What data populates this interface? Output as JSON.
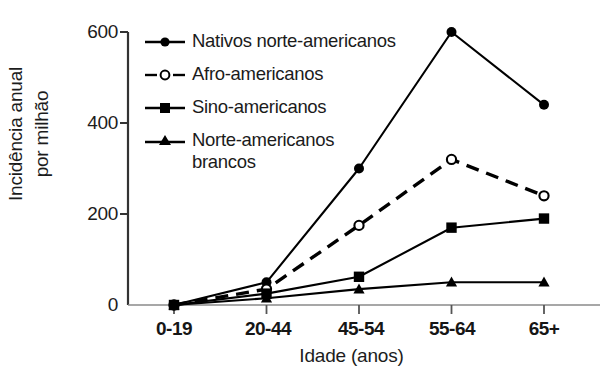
{
  "chart_data": {
    "type": "line",
    "title": "",
    "xlabel": "Idade (anos)",
    "ylabel": "Incidência anual\npor milhão",
    "categories": [
      "0-19",
      "20-44",
      "45-54",
      "55-64",
      "65+"
    ],
    "yticks": [
      0,
      200,
      400,
      600
    ],
    "ylim": [
      0,
      620
    ],
    "grid": false,
    "legend_position": "top-left-inside",
    "series": [
      {
        "name": "Nativos norte-americanos",
        "values": [
          0,
          50,
          300,
          600,
          440
        ],
        "marker": "filled-circle",
        "linestyle": "solid",
        "color": "#000000"
      },
      {
        "name": "Afro-americanos",
        "values": [
          0,
          35,
          175,
          320,
          240
        ],
        "marker": "open-circle",
        "linestyle": "dashed",
        "color": "#000000"
      },
      {
        "name": "Sino-americanos",
        "values": [
          0,
          25,
          62,
          170,
          190
        ],
        "marker": "filled-square",
        "linestyle": "solid",
        "color": "#000000"
      },
      {
        "name": "Norte-americanos\nbrancos",
        "values": [
          0,
          15,
          35,
          50,
          50
        ],
        "marker": "filled-triangle",
        "linestyle": "solid",
        "color": "#000000"
      }
    ]
  },
  "axis": {
    "ytick_labels": [
      "600",
      "400",
      "200",
      "0"
    ],
    "xtick_labels": [
      "0-19",
      "20-44",
      "45-54",
      "55-64",
      "65+"
    ],
    "ylabel_text": "Incidência anual\npor milhão",
    "xlabel_text": "Idade (anos)"
  },
  "legend": {
    "items": [
      {
        "label": "Nativos norte-americanos",
        "marker": "filled-circle",
        "linestyle": "solid"
      },
      {
        "label": "Afro-americanos",
        "marker": "open-circle",
        "linestyle": "dashed"
      },
      {
        "label": "Sino-americanos",
        "marker": "filled-square",
        "linestyle": "solid"
      },
      {
        "label": "Norte-americanos\nbrancos",
        "marker": "filled-triangle",
        "linestyle": "solid"
      }
    ]
  },
  "colors": {
    "ink": "#000000",
    "axis": "#3a3a3a",
    "background": "#ffffff"
  }
}
